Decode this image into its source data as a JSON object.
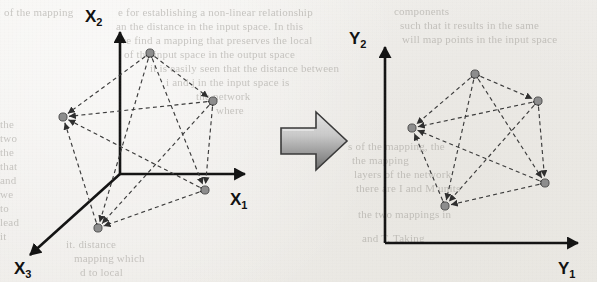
{
  "page": {
    "background_color": "#f2f1ee",
    "ink_color": "#131313",
    "node_color": "#8d8d8d",
    "edge_color": "#3b3b3b",
    "arrow_color_light": "#d2d2d2",
    "arrow_color_dark": "#5a5a5a"
  },
  "left_diagram": {
    "name": "input-space-diagram",
    "axes": [
      {
        "id": "x1",
        "label": "X",
        "subscript": "1",
        "direction": "right"
      },
      {
        "id": "x2",
        "label": "X",
        "subscript": "2",
        "direction": "up"
      },
      {
        "id": "x3",
        "label": "X",
        "subscript": "3",
        "direction": "down-left"
      }
    ],
    "node_count": 5,
    "edge_count": 10,
    "graph_type": "complete graph K5, bidirectional dashed arrows"
  },
  "right_diagram": {
    "name": "output-space-diagram",
    "axes": [
      {
        "id": "y1",
        "label": "Y",
        "subscript": "1",
        "direction": "right"
      },
      {
        "id": "y2",
        "label": "Y",
        "subscript": "2",
        "direction": "up"
      }
    ],
    "node_count": 5,
    "edge_count": 10,
    "graph_type": "complete graph K5, bidirectional dashed arrows"
  },
  "transform_arrow": {
    "name": "mapping-arrow",
    "direction": "right",
    "style": "3d block arrow, gray gradient"
  },
  "chart_data": {
    "type": "scatter",
    "title": "",
    "panels": [
      {
        "name": "left",
        "xlabel": "X1",
        "ylabel": "X2",
        "zlabel": "X3",
        "origin_px": [
          120,
          174
        ],
        "points": [
          {
            "id": "p1",
            "x": 150,
            "y": 53
          },
          {
            "id": "p2",
            "x": 213,
            "y": 101
          },
          {
            "id": "p3",
            "x": 205,
            "y": 190
          },
          {
            "id": "p4",
            "x": 98,
            "y": 228
          },
          {
            "id": "p5",
            "x": 63,
            "y": 117
          }
        ],
        "edges": [
          [
            "p1",
            "p2"
          ],
          [
            "p1",
            "p3"
          ],
          [
            "p1",
            "p4"
          ],
          [
            "p1",
            "p5"
          ],
          [
            "p2",
            "p3"
          ],
          [
            "p2",
            "p4"
          ],
          [
            "p2",
            "p5"
          ],
          [
            "p3",
            "p4"
          ],
          [
            "p3",
            "p5"
          ],
          [
            "p4",
            "p5"
          ]
        ]
      },
      {
        "name": "right",
        "xlabel": "Y1",
        "ylabel": "Y2",
        "origin_px": [
          385,
          243
        ],
        "points": [
          {
            "id": "q1",
            "x": 475,
            "y": 74
          },
          {
            "id": "q2",
            "x": 538,
            "y": 101
          },
          {
            "id": "q3",
            "x": 545,
            "y": 183
          },
          {
            "id": "q4",
            "x": 445,
            "y": 206
          },
          {
            "id": "q5",
            "x": 412,
            "y": 128
          }
        ],
        "edges": [
          [
            "q1",
            "q2"
          ],
          [
            "q1",
            "q3"
          ],
          [
            "q1",
            "q4"
          ],
          [
            "q1",
            "q5"
          ],
          [
            "q2",
            "q3"
          ],
          [
            "q2",
            "q4"
          ],
          [
            "q2",
            "q5"
          ],
          [
            "q3",
            "q4"
          ],
          [
            "q3",
            "q5"
          ],
          [
            "q4",
            "q5"
          ]
        ]
      }
    ]
  },
  "background_text": {
    "note": "faint scanned text bleeding through from the printed page",
    "lines": [
      {
        "text": "of the mapping",
        "x": 4,
        "y": 6,
        "size": 11
      },
      {
        "text": "e for establishing a non-linear relationship",
        "x": 118,
        "y": 6,
        "size": 11
      },
      {
        "text": "an the distance in the input space. In this",
        "x": 116,
        "y": 20,
        "size": 11
      },
      {
        "text": "we find a mapping that preserves the local",
        "x": 118,
        "y": 34,
        "size": 11
      },
      {
        "text": "of the input space in the output space",
        "x": 124,
        "y": 48,
        "size": 11
      },
      {
        "text": "it is easily seen that the distance between",
        "x": 150,
        "y": 62,
        "size": 11
      },
      {
        "text": "i and j in the input space is",
        "x": 166,
        "y": 76,
        "size": 11
      },
      {
        "text": "the network",
        "x": 196,
        "y": 90,
        "size": 11
      },
      {
        "text": "where",
        "x": 216,
        "y": 104,
        "size": 11
      },
      {
        "text": "components",
        "x": 394,
        "y": 5,
        "size": 11
      },
      {
        "text": "such that it results in the same",
        "x": 400,
        "y": 19,
        "size": 11
      },
      {
        "text": "will map points in the input space",
        "x": 402,
        "y": 33,
        "size": 11
      },
      {
        "text": "the",
        "x": 0,
        "y": 118,
        "size": 11
      },
      {
        "text": "two",
        "x": 0,
        "y": 132,
        "size": 11
      },
      {
        "text": "the",
        "x": 0,
        "y": 146,
        "size": 11
      },
      {
        "text": "that",
        "x": 0,
        "y": 160,
        "size": 11
      },
      {
        "text": "and",
        "x": 0,
        "y": 174,
        "size": 11
      },
      {
        "text": "we",
        "x": 0,
        "y": 188,
        "size": 11
      },
      {
        "text": "to",
        "x": 0,
        "y": 202,
        "size": 11
      },
      {
        "text": "lead",
        "x": 0,
        "y": 216,
        "size": 11
      },
      {
        "text": "it",
        "x": 0,
        "y": 230,
        "size": 11
      },
      {
        "text": "s of the mapping, the",
        "x": 348,
        "y": 140,
        "size": 11
      },
      {
        "text": "the mapping",
        "x": 352,
        "y": 154,
        "size": 11
      },
      {
        "text": "layers of the network",
        "x": 354,
        "y": 168,
        "size": 11
      },
      {
        "text": "there are I and M units",
        "x": 356,
        "y": 182,
        "size": 11
      },
      {
        "text": "the two mappings in",
        "x": 358,
        "y": 208,
        "size": 11
      },
      {
        "text": "and T. Taking",
        "x": 362,
        "y": 232,
        "size": 11
      },
      {
        "text": "it. distance",
        "x": 66,
        "y": 238,
        "size": 11
      },
      {
        "text": "mapping which",
        "x": 74,
        "y": 252,
        "size": 11
      },
      {
        "text": "d to local",
        "x": 80,
        "y": 266,
        "size": 11
      }
    ]
  }
}
